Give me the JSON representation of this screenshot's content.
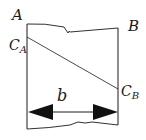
{
  "diagram": {
    "labels": {
      "top_left": "A",
      "top_right": "B",
      "conc_left": "C",
      "conc_left_sub": "A",
      "conc_right": "C",
      "conc_right_sub": "B",
      "width": "b"
    },
    "colors": {
      "stroke": "#1a1a1a",
      "background": "#ffffff"
    }
  }
}
